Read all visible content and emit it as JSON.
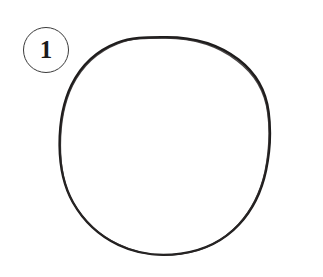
{
  "canvas": {
    "width": 323,
    "height": 277,
    "background_color": "#ffffff"
  },
  "step_badge": {
    "label": "1",
    "shape": "circle-outline",
    "stroke_color": "#3a3a3a",
    "text_color": "#1b1b1b",
    "diameter_px": 46,
    "position": {
      "x": 23,
      "y": 27
    }
  },
  "figure": {
    "name": "hand-drawn-circle",
    "shape": "circle-outline",
    "stroke_color": "#1e1c1c",
    "fill": "none",
    "stroke_width_px": 2.4,
    "bounds": {
      "x": 58,
      "y": 33,
      "width": 215,
      "height": 225
    },
    "center": {
      "x": 165,
      "y": 145
    },
    "radius_x": 106,
    "radius_y": 111
  }
}
